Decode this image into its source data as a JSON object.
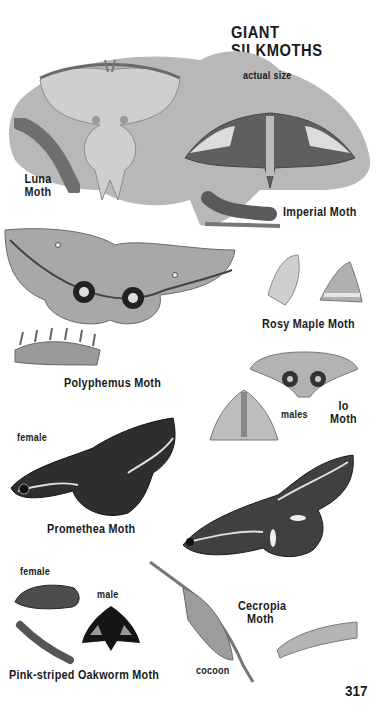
{
  "page": {
    "title": "GIANT SILKMOTHS",
    "page_number": "317",
    "scale_note": "actual size"
  },
  "species": [
    {
      "name": "Luna Moth",
      "line1": "Luna",
      "line2": "Moth",
      "illustrations": [
        "adult",
        "caterpillar"
      ]
    },
    {
      "name": "Imperial Moth",
      "illustrations": [
        "adult",
        "caterpillar"
      ]
    },
    {
      "name": "Polyphemus Moth",
      "illustrations": [
        "adult",
        "caterpillar"
      ]
    },
    {
      "name": "Rosy Maple Moth",
      "illustrations": [
        "adult side view",
        "adult top view"
      ]
    },
    {
      "name": "Io Moth",
      "line1": "Io",
      "line2": "Moth",
      "illustrations": [
        "male",
        "male"
      ],
      "sex_label": "males"
    },
    {
      "name": "Promethea Moth",
      "illustrations": [
        "female"
      ],
      "sex_label": "female"
    },
    {
      "name": "Cecropia Moth",
      "line1": "Cecropia",
      "line2": "Moth",
      "illustrations": [
        "adult",
        "cocoon",
        "caterpillar"
      ],
      "cocoon_label": "cocoon"
    },
    {
      "name": "Pink-striped Oakworm Moth",
      "illustrations": [
        "female",
        "male",
        "caterpillar"
      ],
      "female_label": "female",
      "male_label": "male"
    }
  ],
  "colors": {
    "background": "#ffffff",
    "text": "#1a1a1a",
    "scale_silhouette": "#b8b8b8"
  }
}
